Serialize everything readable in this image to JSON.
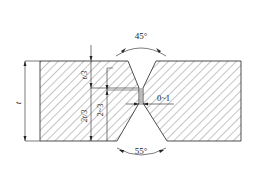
{
  "diagram": {
    "type": "weld-joint-cross-section",
    "labels": {
      "top_angle": "45°",
      "bottom_angle": "55°",
      "root_gap": "0~1",
      "thickness": "t",
      "upper_fraction": "t/3",
      "lower_fraction": "2t/3",
      "root_face": "2~3"
    },
    "colors": {
      "line": "#222222",
      "hatch": "#555555",
      "background": "#ffffff"
    }
  }
}
